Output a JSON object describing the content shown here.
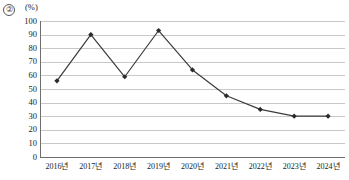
{
  "figure": {
    "item_marker": "②",
    "unit_label": "(%)"
  },
  "chart_data": {
    "type": "line",
    "title": "",
    "subtitle": "",
    "xlabel": "",
    "ylabel": "(%)",
    "categories": [
      "2016년",
      "2017년",
      "2018년",
      "2019년",
      "2020년",
      "2021년",
      "2022년",
      "2023년",
      "2024년"
    ],
    "values": [
      56,
      90,
      59,
      93,
      64,
      45,
      35,
      30,
      30
    ],
    "series": [
      {
        "name": "",
        "values": [
          56,
          90,
          59,
          93,
          64,
          45,
          35,
          30,
          30
        ]
      }
    ],
    "ylim": [
      0,
      100
    ],
    "ytick_labels": [
      "100",
      "90",
      "80",
      "70",
      "60",
      "50",
      "40",
      "30",
      "20",
      "10",
      "0"
    ],
    "ytick_values": [
      100,
      90,
      80,
      70,
      60,
      50,
      40,
      30,
      20,
      10,
      0
    ],
    "ytick_step": 10,
    "grid": true,
    "grid_axis": "y",
    "legend": false,
    "legend_position": "none",
    "marker": "diamond",
    "line_color": "#3b3b3b",
    "marker_color": "#2b2b2b",
    "grid_color": "#c8c8c8",
    "axis_color": "#6e6e6e",
    "annotations": []
  }
}
